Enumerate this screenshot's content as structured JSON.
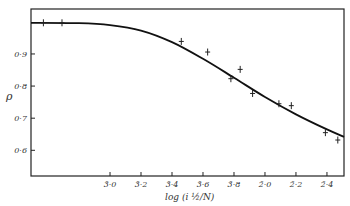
{
  "chart_data": {
    "type": "line",
    "title": "",
    "xlabel": "log (i ½/N)",
    "ylabel": "ρ",
    "x_tick_labels": [
      "3̄·0",
      "3̄·2",
      "3̄·4",
      "3̄·6",
      "3̄·8",
      "2̄·0",
      "2̄·2",
      "2̄·4"
    ],
    "x_tick_values": [
      -3.0,
      -2.8,
      -2.6,
      -2.4,
      -2.2,
      -2.0,
      -1.8,
      -1.6
    ],
    "y_tick_labels": [
      "0·9",
      "0·8",
      "0·7",
      "0·6"
    ],
    "y_tick_values": [
      0.9,
      0.8,
      0.7,
      0.6
    ],
    "xlim": [
      -3.51,
      -1.49
    ],
    "ylim": [
      0.52,
      1.04
    ],
    "grid": false,
    "legend": null,
    "series": [
      {
        "name": "experimental points",
        "marker": "+",
        "x": [
          -3.43,
          -3.31,
          -2.54,
          -2.37,
          -2.22,
          -2.16,
          -2.08,
          -1.91,
          -1.83,
          -1.61,
          -1.53
        ],
        "y": [
          0.997,
          0.997,
          0.939,
          0.906,
          0.823,
          0.852,
          0.777,
          0.745,
          0.739,
          0.655,
          0.632
        ]
      },
      {
        "name": "theoretical curve",
        "marker": "none",
        "x": [
          -3.51,
          -3.2,
          -3.0,
          -2.8,
          -2.6,
          -2.4,
          -2.2,
          -2.0,
          -1.8,
          -1.6,
          -1.49
        ],
        "y": [
          0.997,
          0.996,
          0.99,
          0.973,
          0.937,
          0.885,
          0.826,
          0.766,
          0.712,
          0.665,
          0.642
        ]
      }
    ]
  }
}
